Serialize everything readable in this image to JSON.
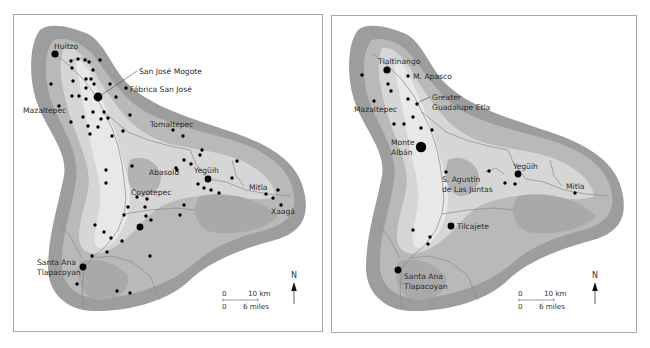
{
  "colors": {
    "outline_fill": "#9d9d9d",
    "mid_fill": "#b9b9b9",
    "valley_fill": "#dcdcdc",
    "floor_fill": "#ececec",
    "river": "#8a8a8a",
    "site": "#000000",
    "frame": "#a8a8a8"
  },
  "maps": [
    {
      "id": "left",
      "sites_small": [
        [
          71,
          61
        ],
        [
          78,
          59
        ],
        [
          85,
          60
        ],
        [
          89,
          62
        ],
        [
          100,
          60
        ],
        [
          72,
          68
        ],
        [
          93,
          70
        ],
        [
          51,
          84
        ],
        [
          73,
          81
        ],
        [
          86,
          79
        ],
        [
          91,
          79
        ],
        [
          94,
          84
        ],
        [
          86,
          88
        ],
        [
          110,
          84
        ],
        [
          126,
          88
        ],
        [
          72,
          96
        ],
        [
          79,
          96
        ],
        [
          86,
          99
        ],
        [
          116,
          97
        ],
        [
          59,
          106
        ],
        [
          93,
          112
        ],
        [
          104,
          112
        ],
        [
          83,
          117
        ],
        [
          71,
          122
        ],
        [
          101,
          119
        ],
        [
          108,
          118
        ],
        [
          130,
          115
        ],
        [
          88,
          126
        ],
        [
          98,
          127
        ],
        [
          90,
          134
        ],
        [
          112,
          136
        ],
        [
          123,
          131
        ],
        [
          173,
          130
        ],
        [
          183,
          136
        ],
        [
          132,
          166
        ],
        [
          106,
          170
        ],
        [
          191,
          164
        ],
        [
          200,
          155
        ],
        [
          184,
          160
        ],
        [
          177,
          170
        ],
        [
          176,
          168
        ],
        [
          202,
          150
        ],
        [
          237,
          161
        ],
        [
          232,
          178
        ],
        [
          106,
          183
        ],
        [
          137,
          197
        ],
        [
          147,
          199
        ],
        [
          128,
          207
        ],
        [
          124,
          215
        ],
        [
          145,
          207
        ],
        [
          146,
          216
        ],
        [
          151,
          220
        ],
        [
          184,
          205
        ],
        [
          180,
          215
        ],
        [
          95,
          225
        ],
        [
          104,
          232
        ],
        [
          111,
          238
        ],
        [
          122,
          241
        ],
        [
          107,
          252
        ],
        [
          92,
          256
        ],
        [
          150,
          256
        ],
        [
          77,
          284
        ],
        [
          117,
          291
        ],
        [
          130,
          293
        ],
        [
          198,
          184
        ],
        [
          204,
          188
        ],
        [
          211,
          190
        ],
        [
          219,
          193
        ],
        [
          266,
          194
        ],
        [
          278,
          190
        ],
        [
          273,
          198
        ],
        [
          281,
          205
        ]
      ],
      "sites_large": [
        {
          "x": 55,
          "y": 54,
          "r": 3.6
        },
        {
          "x": 98,
          "y": 97,
          "r": 4.4
        },
        {
          "x": 208,
          "y": 179,
          "r": 3.4
        },
        {
          "x": 140,
          "y": 227,
          "r": 3.4
        },
        {
          "x": 83,
          "y": 267,
          "r": 3.4
        }
      ],
      "labels": [
        {
          "text": "Huitzo",
          "x": 54,
          "y": 49
        },
        {
          "text": "San José Mogote",
          "x": 139,
          "y": 74
        },
        {
          "text": "Fábrica San José",
          "x": 130,
          "y": 92
        },
        {
          "text": "Mazaltepec",
          "x": 23,
          "y": 113
        },
        {
          "text": "Tomaltepec",
          "x": 150,
          "y": 127
        },
        {
          "text": "Abasolo",
          "x": 149,
          "y": 175
        },
        {
          "text": "Yegüih",
          "x": 194,
          "y": 173
        },
        {
          "text": "Coyotepec",
          "x": 131,
          "y": 195
        },
        {
          "text": "Mitla",
          "x": 249,
          "y": 190
        },
        {
          "text": "Xaagá",
          "x": 271,
          "y": 214
        },
        {
          "text": "Santa Ana",
          "x": 37,
          "y": 265
        },
        {
          "text": "Tlapacoyan",
          "x": 37,
          "y": 275
        }
      ],
      "leader_lines": [
        {
          "x1": 100,
          "y1": 96,
          "x2": 137,
          "y2": 71
        }
      ],
      "scale": {
        "x": 222,
        "y": 300,
        "km_zero": "0",
        "km_label": "10 km",
        "mi_zero": "0",
        "mi_label": "6 miles"
      },
      "north": {
        "x": 294,
        "y": 290,
        "label": "N"
      }
    },
    {
      "id": "right",
      "sites_small": [
        [
          362,
          75
        ],
        [
          408,
          76
        ],
        [
          388,
          84
        ],
        [
          391,
          91
        ],
        [
          374,
          101
        ],
        [
          408,
          99
        ],
        [
          417,
          104
        ],
        [
          413,
          117
        ],
        [
          394,
          124
        ],
        [
          404,
          124
        ],
        [
          421,
          128
        ],
        [
          432,
          130
        ],
        [
          446,
          172
        ],
        [
          489,
          171
        ],
        [
          505,
          183
        ],
        [
          515,
          184
        ],
        [
          575,
          193
        ],
        [
          413,
          230
        ],
        [
          430,
          237
        ],
        [
          428,
          244
        ]
      ],
      "sites_large": [
        {
          "x": 387,
          "y": 70,
          "r": 3.6
        },
        {
          "x": 421,
          "y": 147,
          "r": 5.2
        },
        {
          "x": 518,
          "y": 174,
          "r": 3.4
        },
        {
          "x": 451,
          "y": 226,
          "r": 3.4
        },
        {
          "x": 398,
          "y": 270,
          "r": 3.4
        }
      ],
      "labels": [
        {
          "text": "Tlaltinango",
          "x": 378,
          "y": 64
        },
        {
          "text": "M. Apasco",
          "x": 413,
          "y": 79
        },
        {
          "text": "Greater",
          "x": 432,
          "y": 100
        },
        {
          "text": "Guadalupe Etla",
          "x": 432,
          "y": 110
        },
        {
          "text": "Mazaltepec",
          "x": 354,
          "y": 112
        },
        {
          "text": "Monte",
          "x": 391,
          "y": 145
        },
        {
          "text": "Albán",
          "x": 391,
          "y": 155
        },
        {
          "text": "Yegüih",
          "x": 513,
          "y": 169
        },
        {
          "text": "S. Agustín",
          "x": 442,
          "y": 182
        },
        {
          "text": "de Las Juntas",
          "x": 442,
          "y": 192
        },
        {
          "text": "Mitla",
          "x": 566,
          "y": 189
        },
        {
          "text": "Tilcajete",
          "x": 457,
          "y": 229
        },
        {
          "text": "Santa Ana",
          "x": 404,
          "y": 279
        },
        {
          "text": "Tlapacoyan",
          "x": 404,
          "y": 289
        }
      ],
      "leader_lines": [
        {
          "x1": 419,
          "y1": 102,
          "x2": 430,
          "y2": 97
        }
      ],
      "scale": {
        "x": 518,
        "y": 300,
        "km_zero": "0",
        "km_label": "10 km",
        "mi_zero": "0",
        "mi_label": "6 miles"
      },
      "north": {
        "x": 595,
        "y": 290,
        "label": "N"
      }
    }
  ]
}
